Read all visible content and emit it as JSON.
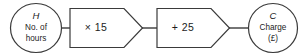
{
  "diagram": {
    "type": "function-machine",
    "stroke_color": "#3a3a3a",
    "text_color": "#1c1c1c",
    "background_color": "#ffffff",
    "input_node": {
      "variable": "H",
      "description_line1": "No. of",
      "description_line2": "hours"
    },
    "operations": [
      {
        "label": "× 15",
        "operator": "multiply",
        "operand": "15"
      },
      {
        "label": "+ 25",
        "operator": "add",
        "operand": "25"
      }
    ],
    "output_node": {
      "variable": "C",
      "description_line1": "Charge",
      "description_line2": "(£)"
    }
  }
}
